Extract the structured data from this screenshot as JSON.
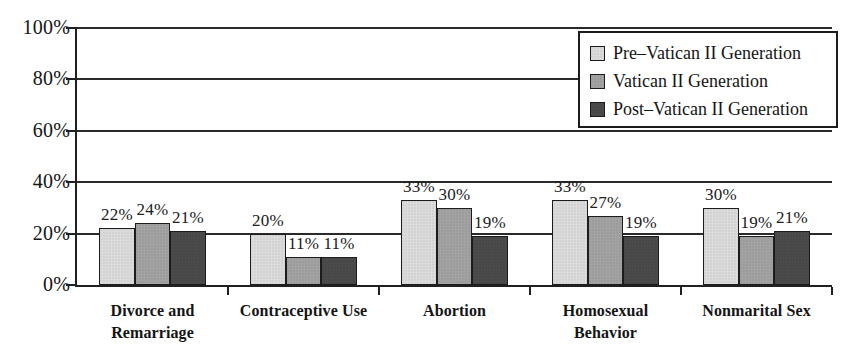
{
  "chart_data": {
    "type": "bar",
    "title": "",
    "subtitle": "",
    "xlabel": "",
    "ylabel": "",
    "ylim": [
      0,
      100
    ],
    "y_unit": "%",
    "grid": true,
    "legend_position": "top-right",
    "y_ticks": [
      "0%",
      "20%",
      "40%",
      "60%",
      "80%",
      "100%"
    ],
    "y_tick_values": [
      0,
      20,
      40,
      60,
      80,
      100
    ],
    "categories": [
      "Divorce and Remarriage",
      "Contraceptive Use",
      "Abortion",
      "Homosexual Behavior",
      "Nonmarital Sex"
    ],
    "category_lines": [
      [
        "Divorce and",
        "Remarriage"
      ],
      [
        "Contraceptive Use"
      ],
      [
        "Abortion"
      ],
      [
        "Homosexual",
        "Behavior"
      ],
      [
        "Nonmarital Sex"
      ]
    ],
    "series": [
      {
        "name": "Pre–Vatican II Generation",
        "color": "#dcdcdc",
        "values": [
          22,
          20,
          33,
          33,
          30
        ],
        "labels": [
          "22%",
          "20%",
          "33%",
          "33%",
          "30%"
        ]
      },
      {
        "name": "Vatican II Generation",
        "color": "#a3a3a3",
        "values": [
          24,
          11,
          30,
          27,
          19
        ],
        "labels": [
          "24%",
          "11%",
          "30%",
          "27%",
          "19%"
        ]
      },
      {
        "name": "Post–Vatican II Generation",
        "color": "#4b4b4b",
        "values": [
          21,
          11,
          19,
          19,
          21
        ],
        "labels": [
          "21%",
          "11%",
          "19%",
          "19%",
          "21%"
        ]
      }
    ]
  },
  "legend": {
    "items": [
      {
        "label": "Pre–Vatican II Generation",
        "swatch_name": "legend-swatch-pre-vatican-ii"
      },
      {
        "label": "Vatican II Generation",
        "swatch_name": "legend-swatch-vatican-ii"
      },
      {
        "label": "Post–Vatican II Generation",
        "swatch_name": "legend-swatch-post-vatican-ii"
      }
    ]
  }
}
